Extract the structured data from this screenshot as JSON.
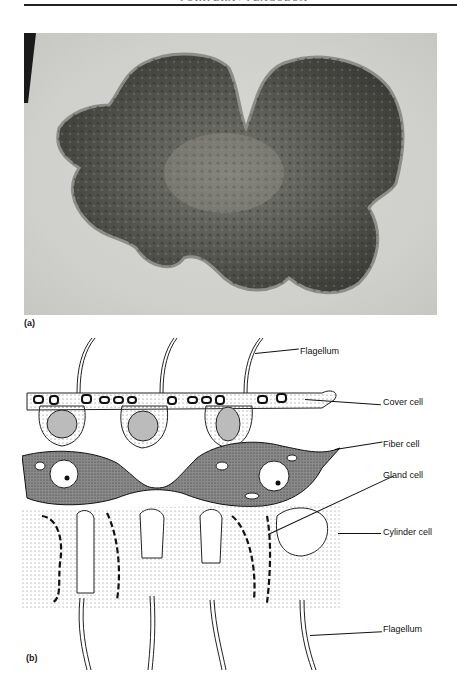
{
  "page": {
    "header_text": "PORIFERA / PLACOZOA",
    "background": "#ffffff"
  },
  "figure": {
    "panel_a": {
      "label": "(a)",
      "description": "micrograph-trichoplax",
      "colors": {
        "background": "#d0d0cc",
        "organism": "#4a4a46"
      }
    },
    "panel_b": {
      "label": "(b)",
      "description": "cross-section-drawing",
      "callouts": [
        {
          "id": "flagellum-top",
          "text": "Flagellum"
        },
        {
          "id": "cover-cell",
          "text": "Cover cell"
        },
        {
          "id": "fiber-cell",
          "text": "Fiber cell"
        },
        {
          "id": "gland-cell",
          "text": "Gland cell"
        },
        {
          "id": "cylinder-cell",
          "text": "Cylinder cell"
        },
        {
          "id": "flagellum-bottom",
          "text": "Flagellum"
        }
      ]
    }
  }
}
